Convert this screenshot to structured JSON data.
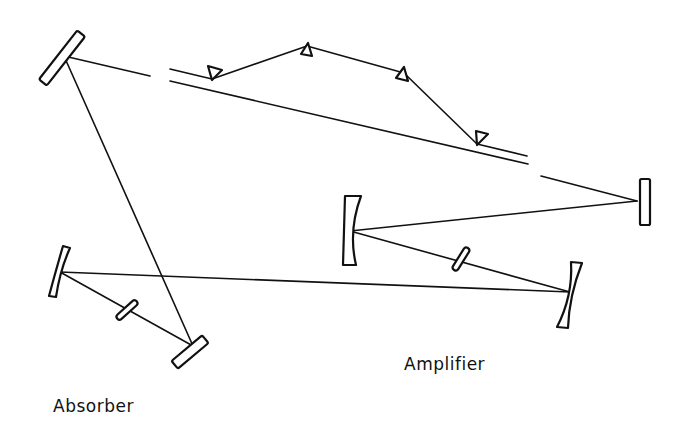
{
  "diagram": {
    "type": "laser-cavity-schematic",
    "labels": {
      "amplifier": "Amplifier",
      "absorber": "Absorber"
    },
    "colors": {
      "line": "#111111",
      "background": "#ffffff"
    },
    "components": [
      {
        "name": "fold-mirror-top-left",
        "kind": "flat-mirror"
      },
      {
        "name": "end-mirror-right",
        "kind": "flat-mirror"
      },
      {
        "name": "amplifier-curved-mirror-left",
        "kind": "curved-mirror"
      },
      {
        "name": "amplifier-curved-mirror-right",
        "kind": "curved-mirror"
      },
      {
        "name": "amplifier-gain-medium",
        "kind": "brewster-plate"
      },
      {
        "name": "absorber-curved-mirror-left",
        "kind": "curved-mirror"
      },
      {
        "name": "absorber-saturable-medium",
        "kind": "brewster-plate"
      },
      {
        "name": "absorber-end-mirror",
        "kind": "flat-mirror"
      },
      {
        "name": "prism-1",
        "kind": "prism"
      },
      {
        "name": "prism-2",
        "kind": "prism"
      },
      {
        "name": "prism-3",
        "kind": "prism"
      },
      {
        "name": "prism-4",
        "kind": "prism"
      }
    ]
  }
}
